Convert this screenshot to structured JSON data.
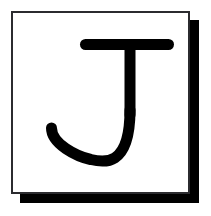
{
  "canvas": {
    "width": 211,
    "height": 216,
    "background_color": "#ffffff"
  },
  "card": {
    "name": "letter-card",
    "fill_color": "#ffffff",
    "border_color": "#2b2b2f",
    "border_width_px": 2,
    "x": 11,
    "y": 11,
    "width": 179,
    "height": 183
  },
  "shadow": {
    "name": "card-drop-shadow",
    "color": "#000000",
    "offset_x": 9,
    "offset_y": 9,
    "thickness_px": 9
  },
  "glyph": {
    "character": "J",
    "label": "Letter J",
    "color": "#000000",
    "style": "serif-slab",
    "top_bar": {
      "x_start": 78,
      "x_end": 172,
      "y_top": 37,
      "y_bottom": 48,
      "thickness_px": 11
    },
    "stem": {
      "x_center": 128,
      "x_left": 122,
      "x_right": 133,
      "y_top": 48,
      "y_bottom": 130,
      "thickness_px": 11
    },
    "hook": {
      "bottom_y": 163,
      "left_terminal_x": 44,
      "left_terminal_y": 126,
      "sweep": "counter-clockwise"
    }
  }
}
